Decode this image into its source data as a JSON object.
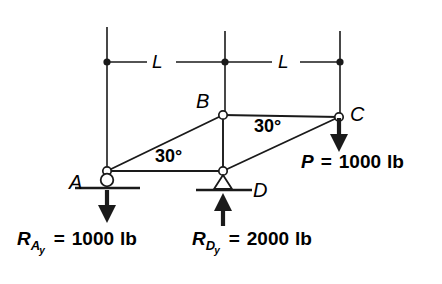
{
  "figure": {
    "stroke_color": "#1a1a1a",
    "fill_color": "#ffffff",
    "background": "#ffffff"
  },
  "nodes": [
    {
      "id": "A",
      "label": "A",
      "x": 107,
      "y": 171,
      "support": "roller"
    },
    {
      "id": "B",
      "label": "B",
      "x": 223,
      "y": 115,
      "support": "none"
    },
    {
      "id": "C",
      "label": "C",
      "x": 339,
      "y": 117,
      "support": "none"
    },
    {
      "id": "D",
      "label": "D",
      "x": 223,
      "y": 171,
      "support": "pin"
    }
  ],
  "members": [
    {
      "from": "A",
      "to": "B"
    },
    {
      "from": "A",
      "to": "D"
    },
    {
      "from": "B",
      "to": "C"
    },
    {
      "from": "B",
      "to": "D"
    },
    {
      "from": "D",
      "to": "C"
    }
  ],
  "angles": [
    {
      "label": "30°",
      "at": "A-B / A-D",
      "x": 177,
      "y": 157
    },
    {
      "label": "30°",
      "at": "C-D / C-B",
      "x": 276,
      "y": 127
    }
  ],
  "dimensions": {
    "line_y": 62,
    "ticks_x": [
      107,
      225,
      340
    ],
    "segments": [
      {
        "label": "L",
        "x": 160,
        "y": 62
      },
      {
        "label": "L",
        "x": 285,
        "y": 62
      }
    ]
  },
  "forces": [
    {
      "name": "applied-load-P",
      "symbol": "P",
      "sub": "",
      "sub2": "",
      "equals": "=",
      "value": "1000",
      "unit": "lb",
      "text": "P = 1000 lb",
      "direction": "down",
      "x": 339,
      "label_x": 301,
      "label_y": 153
    },
    {
      "name": "reaction-A-y",
      "symbol": "R",
      "sub": "A",
      "sub2": "y",
      "equals": "=",
      "value": "1000",
      "unit": "lb",
      "text": "R_Ay = 1000 lb",
      "direction": "down",
      "x": 107,
      "label_x": 17,
      "label_y": 233
    },
    {
      "name": "reaction-D-y",
      "symbol": "R",
      "sub": "D",
      "sub2": "y",
      "equals": "=",
      "value": "2000",
      "unit": "lb",
      "text": "R_Dy = 2000 lb",
      "direction": "up",
      "x": 223,
      "label_x": 192,
      "label_y": 233
    }
  ]
}
